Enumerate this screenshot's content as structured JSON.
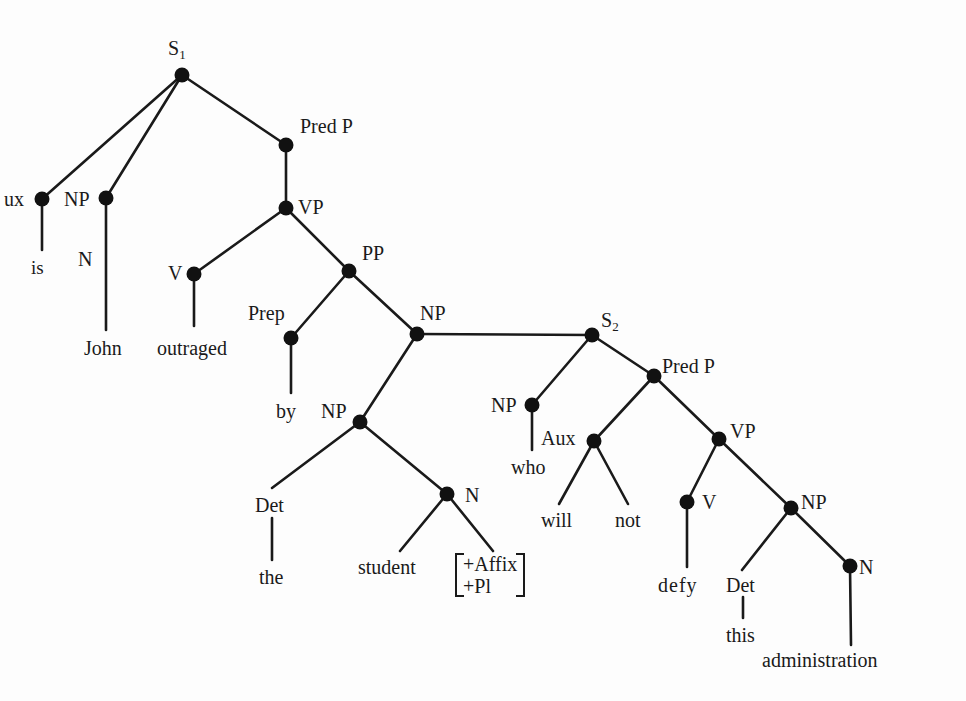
{
  "diagram": {
    "type": "syntax-tree",
    "colors": {
      "line": "#1a1a1a",
      "node": "#111111",
      "background": "#fdfdfd"
    },
    "labels": {
      "s1": {
        "base": "S",
        "sub": "1"
      },
      "aux1": "ux",
      "np1": "NP",
      "n1": "N",
      "is": "is",
      "john": "John",
      "predp1": "Pred P",
      "vp1": "VP",
      "v1": "V",
      "outraged": "outraged",
      "pp": "PP",
      "prep": "Prep",
      "by": "by",
      "np2": "NP",
      "np3": "NP",
      "det1": "Det",
      "the": "the",
      "n2": "N",
      "student": "student",
      "features": [
        "+Affix",
        "+Pl"
      ],
      "s2": {
        "base": "S",
        "sub": "2"
      },
      "np_who": "NP",
      "who": "who",
      "predp2": "Pred P",
      "aux2": "Aux",
      "will": "will",
      "not": "not",
      "vp2": "VP",
      "v2": "V",
      "defy": "defy",
      "np4": "NP",
      "det2": "Det",
      "this": "this",
      "n3": "N",
      "administration": "administration"
    },
    "nodes": [
      {
        "id": "S1",
        "x": 182,
        "y": 75
      },
      {
        "id": "Aux",
        "x": 42,
        "y": 199
      },
      {
        "id": "NP-John",
        "x": 106,
        "y": 198
      },
      {
        "id": "PredP1",
        "x": 286,
        "y": 145
      },
      {
        "id": "VP1",
        "x": 286,
        "y": 208
      },
      {
        "id": "V1",
        "x": 194,
        "y": 274
      },
      {
        "id": "PP",
        "x": 349,
        "y": 271
      },
      {
        "id": "Prep",
        "x": 291,
        "y": 338
      },
      {
        "id": "NP2",
        "x": 417,
        "y": 334
      },
      {
        "id": "NP3",
        "x": 360,
        "y": 422
      },
      {
        "id": "N-student",
        "x": 447,
        "y": 494
      },
      {
        "id": "S2",
        "x": 592,
        "y": 335
      },
      {
        "id": "NP-who",
        "x": 532,
        "y": 405
      },
      {
        "id": "PredP2",
        "x": 654,
        "y": 376
      },
      {
        "id": "Aux2",
        "x": 594,
        "y": 441
      },
      {
        "id": "VP2",
        "x": 719,
        "y": 439
      },
      {
        "id": "V2",
        "x": 687,
        "y": 502
      },
      {
        "id": "NP4",
        "x": 791,
        "y": 508
      },
      {
        "id": "N-admin",
        "x": 850,
        "y": 566
      }
    ]
  }
}
